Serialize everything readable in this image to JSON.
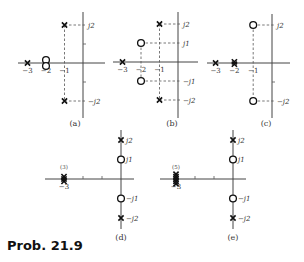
{
  "title": "Prob. 21.9",
  "panels": [
    {
      "id": "a",
      "caption": "(a)",
      "origin": [
        83,
        63
      ],
      "unit_x": 18.5,
      "unit_y": 19,
      "axis_x": [
        18,
        105
      ],
      "axis_y": [
        12,
        118
      ],
      "real_labels": [
        {
          "v": -3,
          "text": "−3"
        },
        {
          "v": -2,
          "text": "−2"
        },
        {
          "v": -1,
          "text": "−1"
        }
      ],
      "imag_labels": [
        {
          "v": 2,
          "text": "j2"
        },
        {
          "v": -2,
          "text": "−j2"
        }
      ],
      "ticks_y": [
        1,
        -1
      ],
      "ticks_x": [],
      "poles": [
        {
          "re": -3,
          "im": 0
        },
        {
          "re": -1,
          "im": 2
        },
        {
          "re": -1,
          "im": -2
        }
      ],
      "zeros": [
        {
          "re": -2,
          "im": 0,
          "count": 2
        }
      ],
      "dashes": [
        {
          "re": -1,
          "im": 2
        },
        {
          "re": -1,
          "im": -2
        }
      ],
      "vdash": [
        {
          "re": -1,
          "from": 2,
          "to": -2
        }
      ],
      "caption_pos": [
        75,
        126
      ]
    },
    {
      "id": "b",
      "caption": "(b)",
      "origin": [
        178,
        62
      ],
      "unit_x": 18.5,
      "unit_y": 19,
      "axis_x": [
        113,
        198
      ],
      "axis_y": [
        12,
        118
      ],
      "real_labels": [
        {
          "v": -3,
          "text": "−3"
        },
        {
          "v": -2,
          "text": "−2"
        },
        {
          "v": -1,
          "text": "−1"
        }
      ],
      "imag_labels": [
        {
          "v": 2,
          "text": "j2"
        },
        {
          "v": 1,
          "text": "j1"
        },
        {
          "v": -1,
          "text": "−j1"
        },
        {
          "v": -2,
          "text": "−j2"
        }
      ],
      "ticks_y": [],
      "ticks_x": [],
      "poles": [
        {
          "re": -3,
          "im": 0
        },
        {
          "re": -1,
          "im": 2
        },
        {
          "re": -1,
          "im": -2
        }
      ],
      "zeros": [
        {
          "re": -2,
          "im": 1,
          "count": 1
        },
        {
          "re": -2,
          "im": -1,
          "count": 1
        }
      ],
      "dashes": [
        {
          "re": -1,
          "im": 2
        },
        {
          "re": -1,
          "im": -2
        },
        {
          "re": -2,
          "im": 1
        },
        {
          "re": -2,
          "im": -1
        }
      ],
      "vdash": [
        {
          "re": -1,
          "from": 2,
          "to": -2
        },
        {
          "re": -2,
          "from": 1,
          "to": -1
        }
      ],
      "caption_pos": [
        172,
        126
      ]
    },
    {
      "id": "c",
      "caption": "(c)",
      "origin": [
        272,
        63
      ],
      "unit_x": 18.8,
      "unit_y": 19,
      "axis_x": [
        207,
        290
      ],
      "axis_y": [
        14,
        118
      ],
      "real_labels": [
        {
          "v": -3,
          "text": "−3"
        },
        {
          "v": -2,
          "text": "−2"
        },
        {
          "v": -1,
          "text": "−1"
        }
      ],
      "imag_labels": [
        {
          "v": 2,
          "text": "j2"
        },
        {
          "v": -2,
          "text": "−j2"
        }
      ],
      "ticks_y": [
        -1
      ],
      "ticks_x": [],
      "poles": [
        {
          "re": -3,
          "im": 0
        },
        {
          "re": -2,
          "im": 0,
          "count": 2
        }
      ],
      "zeros": [
        {
          "re": -1,
          "im": 2,
          "count": 1
        },
        {
          "re": -1,
          "im": -2,
          "count": 1
        }
      ],
      "dashes": [
        {
          "re": -1,
          "im": 2
        },
        {
          "re": -1,
          "im": -2
        }
      ],
      "vdash": [
        {
          "re": -1,
          "from": 2,
          "to": -2
        }
      ],
      "caption_pos": [
        266,
        126
      ]
    },
    {
      "id": "d",
      "caption": "(d)",
      "origin": [
        121,
        179
      ],
      "unit_x": 19,
      "unit_y": 19.5,
      "axis_x": [
        45,
        134
      ],
      "axis_y": [
        130,
        229
      ],
      "real_labels": [
        {
          "v": -3,
          "text": "−3"
        }
      ],
      "imag_labels": [
        {
          "v": 2,
          "text": "j2"
        },
        {
          "v": 1,
          "text": "j1"
        },
        {
          "v": -1,
          "text": "−j1"
        },
        {
          "v": -2,
          "text": "−j2"
        }
      ],
      "ticks_y": [],
      "ticks_x": [
        -2,
        -1
      ],
      "poles": [
        {
          "re": 0,
          "im": 2
        },
        {
          "re": 0,
          "im": -2
        },
        {
          "re": -3,
          "im": 0,
          "count": 3
        }
      ],
      "zeros": [
        {
          "re": 0,
          "im": 1,
          "count": 1
        },
        {
          "re": 0,
          "im": -1,
          "count": 1
        }
      ],
      "multiplicity": {
        "re": -3,
        "text": "(3)"
      },
      "dashes": [],
      "vdash": [],
      "caption_pos": [
        121,
        240
      ]
    },
    {
      "id": "e",
      "caption": "(e)",
      "origin": [
        233,
        179
      ],
      "unit_x": 19,
      "unit_y": 19.5,
      "axis_x": [
        160,
        246
      ],
      "axis_y": [
        130,
        229
      ],
      "real_labels": [
        {
          "v": -3,
          "text": "−3"
        }
      ],
      "imag_labels": [
        {
          "v": 2,
          "text": "j2"
        },
        {
          "v": 1,
          "text": "j1"
        },
        {
          "v": -1,
          "text": "−j1"
        },
        {
          "v": -2,
          "text": "−j2"
        }
      ],
      "ticks_y": [],
      "ticks_x": [
        -2,
        -1
      ],
      "poles": [
        {
          "re": 0,
          "im": 2
        },
        {
          "re": 0,
          "im": -2
        },
        {
          "re": -3,
          "im": 0,
          "count": 5
        }
      ],
      "zeros": [
        {
          "re": 0,
          "im": 1,
          "count": 1
        },
        {
          "re": 0,
          "im": -1,
          "count": 1
        }
      ],
      "multiplicity": {
        "re": -3,
        "text": "(5)"
      },
      "dashes": [],
      "vdash": [],
      "caption_pos": [
        233,
        240
      ]
    }
  ]
}
